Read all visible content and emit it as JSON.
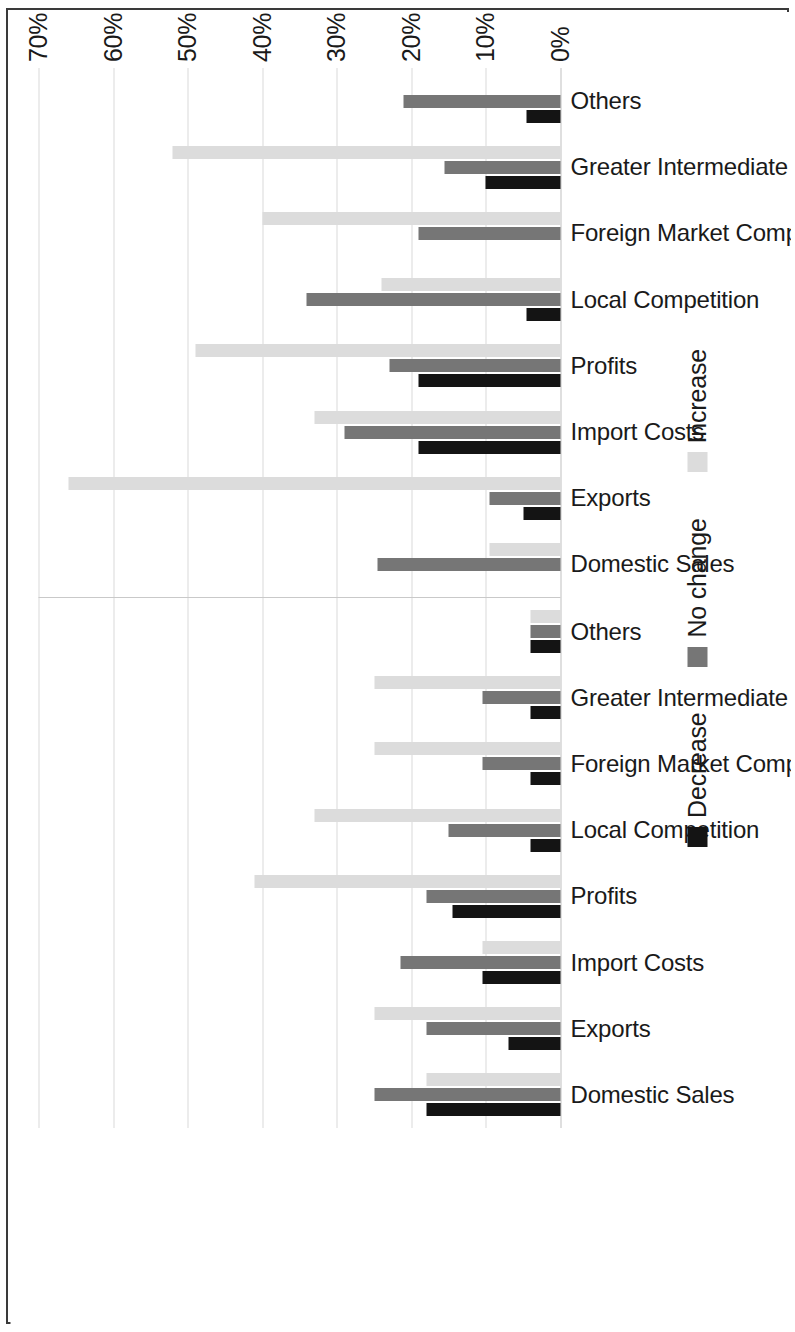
{
  "chart_data": {
    "type": "bar",
    "title": "",
    "subtitle": "",
    "xlabel": "",
    "ylabel": "",
    "orientation": "rotated-90-ccw",
    "grid": true,
    "legend_position": "bottom",
    "ylim": [
      0,
      70
    ],
    "tick_labels": [
      "0%",
      "10%",
      "20%",
      "30%",
      "40%",
      "50%",
      "60%",
      "70%"
    ],
    "tick_values": [
      0,
      10,
      20,
      30,
      40,
      50,
      60,
      70
    ],
    "value_suffix": "%",
    "legend": [
      {
        "name": "Decrease",
        "color": "#141414"
      },
      {
        "name": "No change",
        "color": "#767676"
      },
      {
        "name": "Increase",
        "color": "#dcdcdc"
      }
    ],
    "categories": [
      "Domestic Sales",
      "Exports",
      "Import Costs",
      "Profits",
      "Local Competition",
      "Foreign Market Competition",
      "Greater Intermediate Input Access",
      "Others"
    ],
    "groups": [
      {
        "name": "SMEs",
        "series": [
          {
            "name": "Decrease",
            "values": [
              18.0,
              7.0,
              10.5,
              14.5,
              4.0,
              4.0,
              4.0,
              4.0
            ]
          },
          {
            "name": "No change",
            "values": [
              25.0,
              18.0,
              21.5,
              18.0,
              15.0,
              10.5,
              10.5,
              4.0
            ]
          },
          {
            "name": "Increase",
            "values": [
              18.0,
              25.0,
              10.5,
              41.0,
              33.0,
              25.0,
              25.0,
              4.0
            ]
          }
        ]
      },
      {
        "name": "Large Enterprises",
        "series": [
          {
            "name": "Decrease",
            "values": [
              0.0,
              5.0,
              19.0,
              19.0,
              4.5,
              0.0,
              10.0,
              4.5
            ]
          },
          {
            "name": "No change",
            "values": [
              24.5,
              9.5,
              29.0,
              23.0,
              34.0,
              19.0,
              15.5,
              21.0
            ]
          },
          {
            "name": "Increase",
            "values": [
              9.5,
              66.0,
              33.0,
              49.0,
              24.0,
              40.0,
              52.0,
              0.0
            ]
          }
        ]
      }
    ]
  }
}
